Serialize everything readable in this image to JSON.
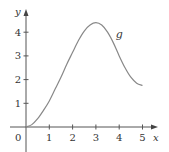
{
  "chart_data": {
    "type": "line",
    "title": "",
    "xlabel": "x",
    "ylabel": "y",
    "xlim": [
      0,
      5
    ],
    "ylim": [
      0,
      4.5
    ],
    "xticks": [
      1,
      2,
      3,
      4,
      5
    ],
    "yticks": [
      1,
      2,
      3,
      4
    ],
    "origin_label": "0",
    "grid": false,
    "legend": null,
    "series": [
      {
        "name": "g",
        "x": [
          0,
          0.25,
          0.5,
          0.75,
          1,
          1.25,
          1.5,
          1.75,
          2,
          2.25,
          2.5,
          2.75,
          3,
          3.25,
          3.5,
          3.75,
          4,
          4.25,
          4.5,
          4.75,
          5
        ],
        "values": [
          0,
          0.1,
          0.35,
          0.7,
          1.1,
          1.6,
          2.1,
          2.65,
          3.15,
          3.65,
          4.05,
          4.3,
          4.4,
          4.3,
          4.0,
          3.55,
          3.0,
          2.5,
          2.1,
          1.85,
          1.75
        ]
      }
    ],
    "annotations": [
      {
        "text": "g",
        "x": 3.85,
        "y": 3.75
      }
    ]
  },
  "labels": {
    "x_axis": "x",
    "y_axis": "y",
    "origin": "0",
    "curve": "g",
    "xticks": [
      "1",
      "2",
      "3",
      "4",
      "5"
    ],
    "yticks": [
      "1",
      "2",
      "3",
      "4"
    ]
  }
}
